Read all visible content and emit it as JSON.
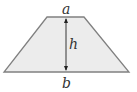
{
  "diagram": {
    "shape": "trapezoid",
    "labels": {
      "top_base": "a",
      "height": "h",
      "bottom_base": "b"
    },
    "colors": {
      "fill": "#ececec",
      "stroke": "#808080",
      "text": "#333333"
    }
  }
}
